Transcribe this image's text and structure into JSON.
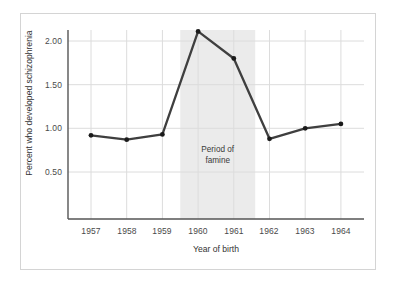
{
  "chart_data": {
    "type": "line",
    "title": "",
    "xlabel": "Year of birth",
    "ylabel": "Percent who developed schizophrenia",
    "categories": [
      "1957",
      "1958",
      "1959",
      "1960",
      "1961",
      "1962",
      "1963",
      "1964"
    ],
    "x": [
      1957,
      1958,
      1959,
      1960,
      1961,
      1962,
      1963,
      1964
    ],
    "values": [
      0.92,
      0.87,
      0.93,
      2.11,
      1.8,
      0.88,
      1.0,
      1.05
    ],
    "series": [
      {
        "name": "Percent who developed schizophrenia",
        "values": [
          0.92,
          0.87,
          0.93,
          2.11,
          1.8,
          0.88,
          1.0,
          1.05
        ]
      }
    ],
    "ytick_labels": [
      "0.50",
      "1.00",
      "1.50",
      "2.00"
    ],
    "ytick_values": [
      0.5,
      1.0,
      1.5,
      2.0
    ],
    "ylim": [
      0.0,
      2.25
    ],
    "xlim": [
      1956.5,
      1964.5
    ],
    "grid": true,
    "legend": "none",
    "line_color": "#3f3f3f",
    "marker_color": "#1a1a1a",
    "grid_color": "#d9d9d9",
    "axis_color": "#555555",
    "annotations": [
      {
        "name": "famine-band",
        "text_line1": "Period of",
        "text_line2": "famine",
        "band_start": 1959.5,
        "band_end": 1961.6,
        "band_color": "#ebebeb"
      }
    ]
  },
  "figure": {
    "frame_color": "#d4d4d4",
    "background": "#ffffff"
  }
}
